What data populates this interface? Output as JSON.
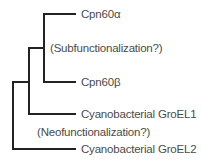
{
  "tree": {
    "leaves": [
      {
        "id": "cpn60a",
        "label": "Cpn60α"
      },
      {
        "id": "cpn60b",
        "label": "Cpn60β"
      },
      {
        "id": "groel1",
        "label": "Cyanobacterial GroEL1"
      },
      {
        "id": "groel2",
        "label": "Cyanobacterial GroEL2"
      }
    ],
    "annotations": {
      "subfunctionalization": "(Subfunctionalization?)",
      "neofunctionalization": "(Neofunctionalization?)"
    },
    "line_color": "#222222"
  }
}
